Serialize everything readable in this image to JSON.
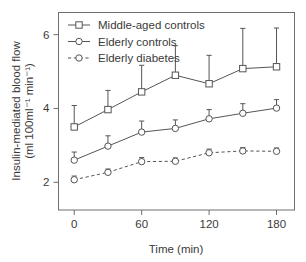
{
  "chart_data": {
    "type": "line",
    "title": "",
    "xlabel": "Time (min)",
    "ylabel": "Insulin-mediated blood flow (ml 100ml⁻¹ min⁻¹)",
    "ylabel_line1": "Insulin-mediated blood flow",
    "ylabel_line2": "(ml 100ml⁻¹ min⁻¹)",
    "x": [
      0,
      30,
      60,
      90,
      120,
      150,
      180
    ],
    "xticks": [
      0,
      60,
      120,
      180
    ],
    "xticklabels": [
      "0",
      "60",
      "120",
      "180"
    ],
    "yticks": [
      2,
      4,
      6
    ],
    "yticklabels": [
      "2",
      "4",
      "6"
    ],
    "xlim": [
      -14,
      196
    ],
    "ylim": [
      1.25,
      6.6
    ],
    "grid": false,
    "legend_position": "top-left",
    "error_bar_direction": "up-only",
    "series": [
      {
        "name": "Middle-aged controls",
        "marker": "open-square",
        "linestyle": "solid",
        "color": "#555555",
        "values": [
          3.5,
          3.97,
          4.45,
          4.9,
          4.67,
          5.08,
          5.13
        ],
        "errors_upper": [
          0.58,
          0.52,
          0.72,
          0.8,
          0.77,
          1.09,
          1.05
        ]
      },
      {
        "name": "Elderly controls",
        "marker": "open-circle",
        "linestyle": "solid",
        "color": "#555555",
        "values": [
          2.6,
          2.98,
          3.36,
          3.46,
          3.72,
          3.87,
          4.01
        ],
        "errors_upper": [
          0.22,
          0.28,
          0.3,
          0.23,
          0.25,
          0.26,
          0.23
        ]
      },
      {
        "name": "Elderly diabetes",
        "marker": "open-circle",
        "linestyle": "dashed",
        "color": "#555555",
        "values": [
          2.07,
          2.27,
          2.56,
          2.57,
          2.8,
          2.85,
          2.84
        ],
        "errors_upper": [
          0.1,
          0.09,
          0.11,
          0.09,
          0.1,
          0.09,
          0.09
        ]
      }
    ]
  },
  "legend": {
    "items": [
      {
        "label": "Middle-aged controls",
        "marker": "open-square",
        "linestyle": "solid"
      },
      {
        "label": "Elderly controls",
        "marker": "open-circle",
        "linestyle": "solid"
      },
      {
        "label": "Elderly diabetes",
        "marker": "open-circle",
        "linestyle": "dashed"
      }
    ]
  },
  "style": {
    "frame_color": "#6e6e6e",
    "line_color": "#555555",
    "text_color": "#3a3a3a",
    "background": "#ffffff"
  }
}
